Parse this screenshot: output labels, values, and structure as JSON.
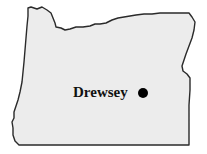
{
  "map": {
    "region": "Oregon",
    "fill_color": "#ececec",
    "outline_color": "#2a2a2a",
    "locations": [
      {
        "label": "Drewsey",
        "marker": "filled-circle",
        "marker_color": "#000000"
      }
    ]
  }
}
